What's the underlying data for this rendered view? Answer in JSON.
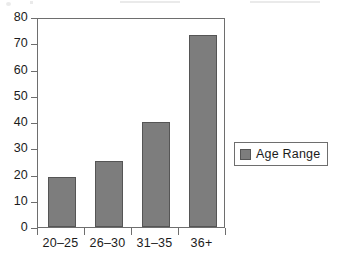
{
  "chart_data": {
    "type": "bar",
    "title": "",
    "subtitle": "",
    "xlabel": "",
    "ylabel": "",
    "categories": [
      "20–25",
      "26–30",
      "31–35",
      "36+"
    ],
    "values": [
      19,
      25,
      40,
      73
    ],
    "series": [
      {
        "name": "Age Range",
        "values": [
          19,
          25,
          40,
          73
        ]
      }
    ],
    "ylim": [
      0,
      80
    ],
    "y_ticks": [
      0,
      10,
      20,
      30,
      40,
      50,
      60,
      70,
      80
    ],
    "y_tick_labels": [
      "0",
      "10",
      "20",
      "30",
      "40",
      "50",
      "60",
      "70",
      "80"
    ],
    "grid": false,
    "legend_position": "right",
    "legend_entries": [
      "Age Range"
    ],
    "annotations": [],
    "colors": {
      "bar_fill": "#7d7d7d",
      "bar_stroke": "#555555",
      "axis": "#6e6e6e",
      "text": "#1b1b1b",
      "background": "#ffffff"
    }
  }
}
